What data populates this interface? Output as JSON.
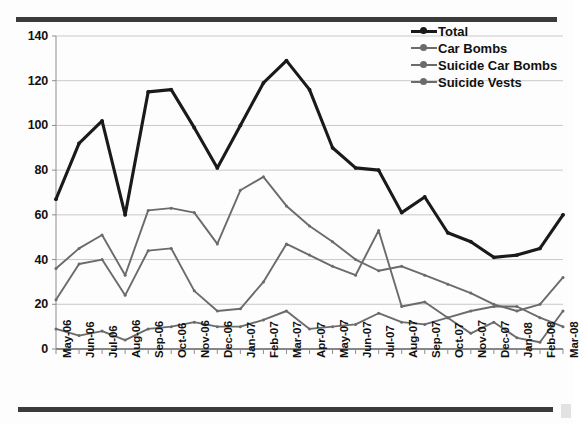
{
  "figure": {
    "top_rule": "horizontal-rule",
    "bottom_rule": "horizontal-rule"
  },
  "legend": {
    "position": "top-right",
    "items": [
      {
        "label": "Total",
        "color": "#1a1a1a",
        "width": 3.1
      },
      {
        "label": "Car Bombs",
        "color": "#6b6b6b",
        "width": 1.9
      },
      {
        "label": "Suicide Car Bombs",
        "color": "#6b6b6b",
        "width": 1.9
      },
      {
        "label": "Suicide Vests",
        "color": "#6b6b6b",
        "width": 1.9
      }
    ]
  },
  "chart_data": {
    "type": "line",
    "title": "",
    "subtitle": "",
    "xlabel": "",
    "ylabel": "",
    "ylim": [
      0,
      140
    ],
    "ytick_step": 20,
    "yticks": [
      0,
      20,
      40,
      60,
      80,
      100,
      120,
      140
    ],
    "grid": true,
    "grid_axis": "y",
    "legend_position": "top-right",
    "markers": true,
    "categories": [
      "May-06",
      "Jun-06",
      "Jul-06",
      "Aug-06",
      "Sep-06",
      "Oct-06",
      "Nov-06",
      "Dec-06",
      "Jan-07",
      "Feb-07",
      "Mar-07",
      "Apr-07",
      "May-07",
      "Jun-07",
      "Jul-07",
      "Aug-07",
      "Sep-07",
      "Oct-07",
      "Nov-07",
      "Dec-07",
      "Jan-08",
      "Feb-08",
      "Mar-08"
    ],
    "series": [
      {
        "name": "Total",
        "color": "#1a1a1a",
        "values": [
          67,
          92,
          102,
          60,
          115,
          116,
          99,
          81,
          100,
          119,
          129,
          116,
          90,
          81,
          80,
          61,
          68,
          52,
          48,
          41,
          42,
          45,
          60
        ]
      },
      {
        "name": "Car Bombs",
        "color": "#6b6b6b",
        "values": [
          36,
          45,
          51,
          33,
          62,
          63,
          61,
          47,
          71,
          77,
          64,
          55,
          48,
          40,
          35,
          37,
          33,
          29,
          25,
          20,
          17,
          20,
          32
        ]
      },
      {
        "name": "Suicide Car Bombs",
        "color": "#6b6b6b",
        "values": [
          22,
          38,
          40,
          24,
          44,
          45,
          26,
          17,
          18,
          30,
          47,
          42,
          37,
          33,
          53,
          19,
          21,
          14,
          17,
          19,
          19,
          14,
          10
        ]
      },
      {
        "name": "Suicide Vests",
        "color": "#6b6b6b",
        "values": [
          9,
          6,
          8,
          4,
          9,
          10,
          12,
          10,
          10,
          13,
          17,
          9,
          10,
          11,
          16,
          12,
          11,
          14,
          7,
          12,
          5,
          3,
          17
        ]
      }
    ]
  }
}
